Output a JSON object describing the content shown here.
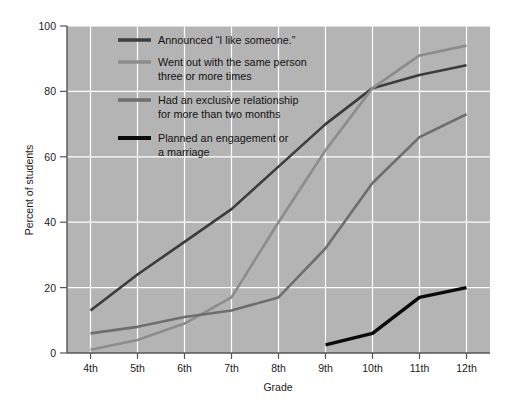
{
  "chart_data": {
    "type": "line",
    "title": "",
    "xlabel": "Grade",
    "ylabel": "Percent of students",
    "categories": [
      "4th",
      "5th",
      "6th",
      "7th",
      "8th",
      "9th",
      "10th",
      "11th",
      "12th"
    ],
    "ylim": [
      0,
      100
    ],
    "yticks": [
      0,
      20,
      40,
      60,
      80,
      100
    ],
    "grid": true,
    "legend_position": "upper-left-inside",
    "plot_background": "#b4b4b4",
    "gridline_color": "#ffffff",
    "series": [
      {
        "name": "Announced \"I like someone.\"",
        "color": "#3c3c3c",
        "values": [
          13,
          24,
          34,
          44,
          57,
          70,
          81,
          85,
          88
        ]
      },
      {
        "name": "Went out with the same person three or more times",
        "color": "#8c8c8c",
        "values": [
          1,
          4,
          9,
          17,
          40,
          62,
          81,
          91,
          94
        ]
      },
      {
        "name": "Had an exclusive relationship for more than two months",
        "color": "#6e6e6e",
        "values": [
          6,
          8,
          11,
          13,
          17,
          32,
          52,
          66,
          73
        ]
      },
      {
        "name": "Planned an engagement or a marriage",
        "color": "#0a0a0a",
        "values": [
          null,
          null,
          null,
          null,
          null,
          2.5,
          6,
          17,
          20
        ]
      }
    ]
  },
  "legend": {
    "entries": [
      {
        "label_line1": "Announced “I like someone.”",
        "label_line2": ""
      },
      {
        "label_line1": "Went out with the same person",
        "label_line2": "three or more times"
      },
      {
        "label_line1": "Had an exclusive relationship",
        "label_line2": "for more than two months"
      },
      {
        "label_line1": "Planned an engagement or",
        "label_line2": "a marriage"
      }
    ]
  }
}
